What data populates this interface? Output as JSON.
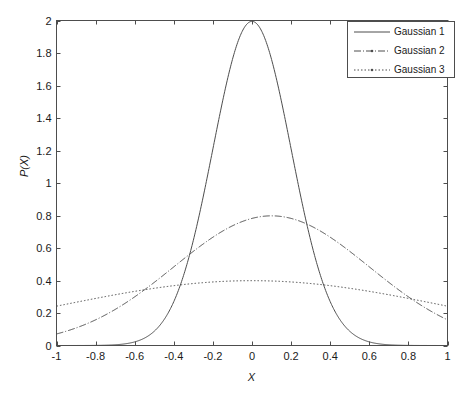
{
  "chart_data": {
    "type": "line",
    "title": "",
    "subtitle": "",
    "xlabel": "X",
    "ylabel": "P(X)",
    "xlim": [
      -1,
      1
    ],
    "ylim": [
      0,
      2
    ],
    "grid": false,
    "legend_position": "top-right",
    "xticks": [
      -1,
      -0.8,
      -0.6,
      -0.4,
      -0.2,
      0,
      0.2,
      0.4,
      0.6,
      0.8,
      1
    ],
    "xtick_labels": [
      "-1",
      "-0.8",
      "-0.6",
      "-0.4",
      "-0.2",
      "0",
      "0.2",
      "0.4",
      "0.6",
      "0.8",
      "1"
    ],
    "yticks": [
      0,
      0.2,
      0.4,
      0.6,
      0.8,
      1,
      1.2,
      1.4,
      1.6,
      1.8,
      2
    ],
    "ytick_labels": [
      "0",
      "0.2",
      "0.4",
      "0.6",
      "0.8",
      "1",
      "1.2",
      "1.4",
      "1.6",
      "1.8",
      "2"
    ],
    "series": [
      {
        "name": "Gaussian 1",
        "mean": 0,
        "sigma": 0.2,
        "peak": 2.0,
        "linestyle": "solid",
        "marker": "none",
        "color": "#4d4d4d",
        "x": [
          -1,
          -0.9,
          -0.8,
          -0.7,
          -0.6,
          -0.5,
          -0.4,
          -0.35,
          -0.3,
          -0.25,
          -0.2,
          -0.15,
          -0.1,
          -0.05,
          0,
          0.05,
          0.1,
          0.15,
          0.2,
          0.25,
          0.3,
          0.35,
          0.4,
          0.5,
          0.6,
          0.7,
          0.8,
          0.9,
          1
        ],
        "y": [
          0,
          0,
          0.001,
          0.005,
          0.022,
          0.088,
          0.27,
          0.432,
          0.648,
          0.912,
          1.213,
          1.515,
          1.76,
          1.94,
          2.0,
          1.94,
          1.76,
          1.515,
          1.213,
          0.912,
          0.648,
          0.432,
          0.27,
          0.088,
          0.022,
          0.005,
          0.001,
          0,
          0
        ]
      },
      {
        "name": "Gaussian 2",
        "mean": 0.1,
        "sigma": 0.5,
        "peak": 0.8,
        "linestyle": "dashdot",
        "marker": "dot",
        "color": "#4d4d4d",
        "x": [
          -1,
          -0.9,
          -0.8,
          -0.7,
          -0.6,
          -0.5,
          -0.4,
          -0.3,
          -0.2,
          -0.1,
          0,
          0.1,
          0.2,
          0.3,
          0.4,
          0.5,
          0.6,
          0.7,
          0.8,
          0.9,
          1
        ],
        "y": [
          0.065,
          0.097,
          0.137,
          0.186,
          0.242,
          0.303,
          0.368,
          0.435,
          0.498,
          0.556,
          0.605,
          0.798,
          0.783,
          0.74,
          0.672,
          0.586,
          0.49,
          0.393,
          0.303,
          0.224,
          0.16
        ]
      },
      {
        "name": "Gaussian 3",
        "mean": 0,
        "sigma": 1.0,
        "peak": 0.4,
        "linestyle": "dotted",
        "marker": "dot",
        "color": "#4d4d4d",
        "x": [
          -1,
          -0.9,
          -0.8,
          -0.7,
          -0.6,
          -0.5,
          -0.4,
          -0.3,
          -0.2,
          -0.1,
          0,
          0.1,
          0.2,
          0.3,
          0.4,
          0.5,
          0.6,
          0.7,
          0.8,
          0.9,
          1
        ],
        "y": [
          0.29,
          0.302,
          0.314,
          0.325,
          0.335,
          0.352,
          0.368,
          0.381,
          0.391,
          0.397,
          0.399,
          0.397,
          0.391,
          0.381,
          0.368,
          0.352,
          0.333,
          0.312,
          0.29,
          0.266,
          0.197
        ]
      }
    ]
  },
  "legend": {
    "entries": [
      {
        "label": "Gaussian 1"
      },
      {
        "label": "Gaussian 2"
      },
      {
        "label": "Gaussian 3"
      }
    ]
  },
  "colors": {
    "axis": "#4d4d4d",
    "line": "#4d4d4d",
    "text": "#1a1a1a",
    "background": "#ffffff"
  }
}
